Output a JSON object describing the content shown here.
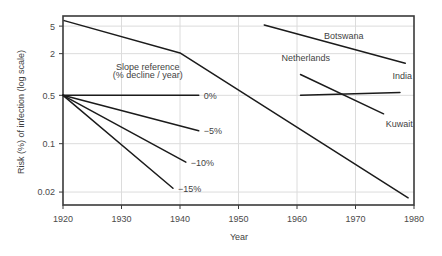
{
  "chart_data": {
    "type": "line",
    "title": "",
    "xlabel": "Year",
    "ylabel": "Risk (%) of infection (log scale)",
    "yscale": "log",
    "xlim": [
      1920,
      1980
    ],
    "ylim": [
      0.013,
      7.0
    ],
    "grid": true,
    "legend_position": "inline-labels",
    "xticks": [
      1920,
      1930,
      1940,
      1950,
      1960,
      1970,
      1980
    ],
    "xtick_labels": [
      "1920",
      "1930",
      "1940",
      "1950",
      "1960",
      "1970",
      "1980"
    ],
    "yticks": [
      5,
      2,
      0.5,
      0.1,
      0.02
    ],
    "ytick_labels": [
      "5",
      "2",
      "0.5",
      "0.1",
      "0.02"
    ],
    "annotations": [
      {
        "text": "Slope reference",
        "x": 1934.5,
        "y": 1.15
      },
      {
        "text": "(% decline / year)",
        "x": 1934.5,
        "y": 0.88
      }
    ],
    "series": [
      {
        "name": "Netherlands",
        "label_x": 1961.5,
        "label_y": 1.55,
        "points": [
          {
            "x": 1920.2,
            "y": 6.0
          },
          {
            "x": 1940.0,
            "y": 2.05
          },
          {
            "x": 1979.0,
            "y": 0.0165
          }
        ]
      },
      {
        "name": "Botswana",
        "label_x": 1968.0,
        "label_y": 3.3,
        "points": [
          {
            "x": 1954.4,
            "y": 5.2
          },
          {
            "x": 1978.5,
            "y": 1.45
          }
        ]
      },
      {
        "name": "India",
        "label_x": 1978.0,
        "label_y": 0.86,
        "points": [
          {
            "x": 1960.6,
            "y": 0.5
          },
          {
            "x": 1977.6,
            "y": 0.55
          }
        ]
      },
      {
        "name": "Kuwait",
        "label_x": 1977.5,
        "label_y": 0.175,
        "points": [
          {
            "x": 1960.6,
            "y": 1.0
          },
          {
            "x": 1974.8,
            "y": 0.27
          }
        ]
      }
    ],
    "reference_slopes": [
      {
        "label": "0%",
        "percent_per_year": 0,
        "x0": 1920.0,
        "y0": 0.5,
        "x1": 1943.2,
        "y1": 0.5
      },
      {
        "label": "−5%",
        "percent_per_year": -5,
        "x0": 1920.0,
        "y0": 0.5,
        "x1": 1943.2,
        "y1": 0.154
      },
      {
        "label": "−10%",
        "percent_per_year": -10,
        "x0": 1920.0,
        "y0": 0.5,
        "x1": 1941.0,
        "y1": 0.054
      },
      {
        "label": "−15%",
        "percent_per_year": -15,
        "x0": 1920.0,
        "y0": 0.5,
        "x1": 1938.8,
        "y1": 0.0227
      }
    ]
  },
  "style": {
    "line_color": "#1b1b1b",
    "axis_color": "#3a3a3a",
    "grid_color": "#dcdcdc",
    "background": "#ffffff"
  }
}
